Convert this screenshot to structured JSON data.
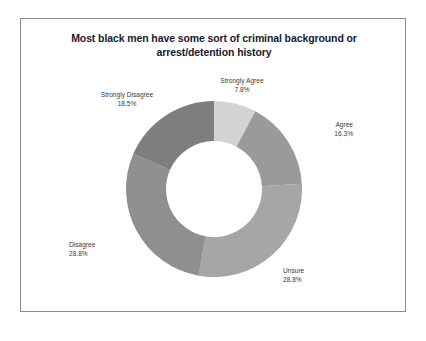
{
  "chart_data": {
    "type": "pie",
    "variant": "donut",
    "title": "Most black men have some sort of criminal background or arrest/detention history",
    "title_lines": [
      "Most black men have some sort of criminal background or",
      "arrest/detention history"
    ],
    "xlabel": "",
    "ylabel": "",
    "legend": "none",
    "grid": false,
    "units": "percent",
    "start_angle_deg": 0,
    "direction": "clockwise",
    "inner_radius_ratio": 0.545,
    "categories": [
      "Strongly Agree",
      "Agree",
      "Unsure",
      "Disagree",
      "Strongly Disagree"
    ],
    "values": [
      7.8,
      16.3,
      28.8,
      28.8,
      18.5
    ],
    "value_labels": [
      "7.8%",
      "16.3%",
      "28.8%",
      "28.8%",
      "18.5%"
    ],
    "colors": [
      "#d3d3d3",
      "#9a9a9a",
      "#a6a6a6",
      "#8f8f8f",
      "#7e7e7e"
    ],
    "slices": [
      {
        "label": "Strongly Agree",
        "value": 7.8,
        "value_label": "7.8%",
        "color": "#d3d3d3"
      },
      {
        "label": "Agree",
        "value": 16.3,
        "value_label": "16.3%",
        "color": "#9a9a9a"
      },
      {
        "label": "Unsure",
        "value": 28.8,
        "value_label": "28.8%",
        "color": "#a6a6a6"
      },
      {
        "label": "Disagree",
        "value": 28.8,
        "value_label": "28.8%",
        "color": "#8f8f8f"
      },
      {
        "label": "Strongly Disagree",
        "value": 18.5,
        "value_label": "18.5%",
        "color": "#7e7e7e"
      }
    ]
  },
  "style": {
    "border_color": "#8a8a8a",
    "background": "#ffffff",
    "title_color": "#1a1a2e",
    "label_color": "#3a3a3a"
  }
}
